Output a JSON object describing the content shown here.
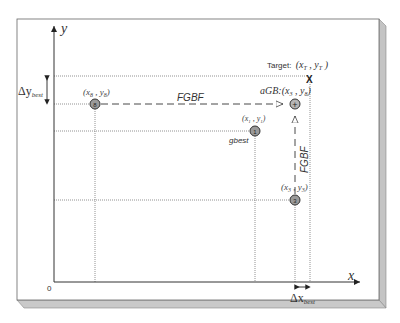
{
  "diagram": {
    "axes": {
      "x_label": "x",
      "y_label": "y",
      "origin_label": "0"
    },
    "target": {
      "label_prefix": "Target:",
      "label_coords": "(x",
      "sub_x": "T",
      "mid": " , y",
      "sub_y": "T",
      "close": " )",
      "marker": "X"
    },
    "particles": [
      {
        "id": "8",
        "label": "(x",
        "sub_x": "8",
        "sep": " , y",
        "sub_y": "8",
        "close": ")",
        "symbol": "8"
      },
      {
        "id": "1",
        "label": "(x",
        "sub_x": "1",
        "sep": " , y",
        "sub_y": "1",
        "close": ")",
        "symbol": "1",
        "tag": "gbest"
      },
      {
        "id": "3",
        "label": "(x",
        "sub_x": "3",
        "sep": " , y",
        "sub_y": "3",
        "close": ")",
        "symbol": "3"
      }
    ],
    "agb": {
      "label": "aGB",
      "coords": ":(x",
      "sub_x": "3",
      "sep": " , y",
      "sub_y": "8",
      "close": ")",
      "symbol": "+"
    },
    "arrows": {
      "horizontal_label": "FGBF",
      "vertical_label": "FGBF"
    },
    "deltas": {
      "dy_main": "Δy",
      "dy_sub": "best",
      "dx_main": "Δx",
      "dx_sub": "best"
    },
    "colors": {
      "line": "#333333",
      "dotted": "#777777",
      "frame_edge": "#b8b8b8",
      "particle_fill": "#9a9a9a"
    }
  }
}
